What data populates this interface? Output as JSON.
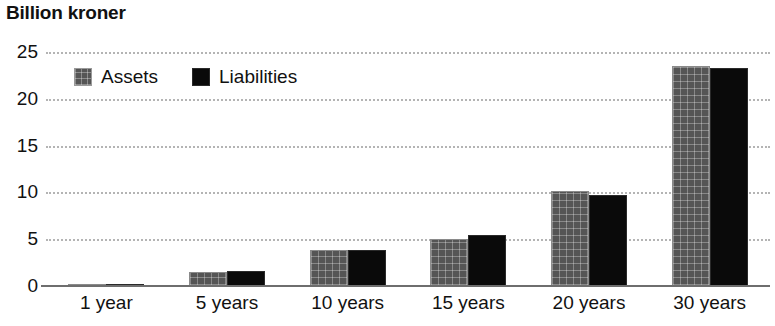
{
  "chart_data": {
    "type": "bar",
    "title": "Billion kroner",
    "xlabel": "",
    "ylabel": "",
    "categories": [
      "1 year",
      "5 years",
      "10 years",
      "15 years",
      "20 years",
      "30 years"
    ],
    "series": [
      {
        "name": "Assets",
        "color": "#555555",
        "values": [
          0.2,
          1.5,
          3.8,
          5.0,
          10.2,
          23.5
        ]
      },
      {
        "name": "Liabilities",
        "color": "#0a0a0a",
        "values": [
          0.2,
          1.6,
          3.9,
          5.4,
          9.7,
          23.3
        ]
      }
    ],
    "ylim": [
      0,
      25
    ],
    "yticks": [
      0,
      5,
      10,
      15,
      20,
      25
    ],
    "ytick_labels": [
      "0",
      "5",
      "10",
      "15",
      "20",
      "25"
    ],
    "grid": true,
    "grid_style": "dotted",
    "grid_color": "#b4b4b4",
    "legend_position": "top-left-inside",
    "axis_color": "#6e6e6e"
  },
  "legend": {
    "items": [
      {
        "label": "Assets",
        "swatch": "assets-swatch-icon"
      },
      {
        "label": "Liabilities",
        "swatch": "liabilities-swatch-icon"
      }
    ]
  }
}
